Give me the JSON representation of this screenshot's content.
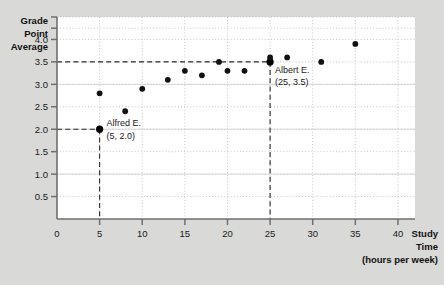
{
  "figure": {
    "background_color": "#d9d9d7",
    "plot_background_color": "#ffffff"
  },
  "axis": {
    "y_title_lines": [
      "Grade",
      "Point",
      "Average"
    ],
    "x_title_lines": [
      "Study",
      "Time",
      "(hours per week)"
    ],
    "y_ticks": [
      "0.5",
      "1.0",
      "1.5",
      "2.0",
      "2.5",
      "3.0",
      "3.5",
      "4.0"
    ],
    "x_ticks": [
      "0",
      "5",
      "10",
      "15",
      "20",
      "25",
      "30",
      "35",
      "40"
    ],
    "origin_label": "0"
  },
  "annotations": [
    {
      "name": "Alfred E.",
      "coords": "(5, 2.0)"
    },
    {
      "name": "Albert E.",
      "coords": "(25, 3.5)"
    }
  ],
  "chart_data": {
    "type": "scatter",
    "title": "",
    "xlabel": "Study Time (hours per week)",
    "ylabel": "Grade Point Average",
    "xlim": [
      0,
      42
    ],
    "ylim": [
      0,
      4.5
    ],
    "grid": true,
    "legend": "none",
    "x": [
      5,
      5,
      8,
      10,
      13,
      15,
      17,
      19,
      20,
      22,
      25,
      25,
      27,
      31,
      35
    ],
    "y": [
      2.0,
      2.8,
      2.4,
      2.9,
      3.1,
      3.3,
      3.2,
      3.5,
      3.3,
      3.3,
      3.5,
      3.6,
      3.6,
      3.5,
      3.9
    ],
    "points": [
      {
        "x": 5,
        "y": 2.0,
        "highlight": true,
        "label": "Alfred E."
      },
      {
        "x": 5,
        "y": 2.8,
        "highlight": false,
        "label": ""
      },
      {
        "x": 8,
        "y": 2.4,
        "highlight": false,
        "label": ""
      },
      {
        "x": 10,
        "y": 2.9,
        "highlight": false,
        "label": ""
      },
      {
        "x": 13,
        "y": 3.1,
        "highlight": false,
        "label": ""
      },
      {
        "x": 15,
        "y": 3.3,
        "highlight": false,
        "label": ""
      },
      {
        "x": 17,
        "y": 3.2,
        "highlight": false,
        "label": ""
      },
      {
        "x": 19,
        "y": 3.5,
        "highlight": false,
        "label": ""
      },
      {
        "x": 20,
        "y": 3.3,
        "highlight": false,
        "label": ""
      },
      {
        "x": 22,
        "y": 3.3,
        "highlight": false,
        "label": ""
      },
      {
        "x": 25,
        "y": 3.5,
        "highlight": true,
        "label": "Albert E."
      },
      {
        "x": 25,
        "y": 3.6,
        "highlight": false,
        "label": ""
      },
      {
        "x": 27,
        "y": 3.6,
        "highlight": false,
        "label": ""
      },
      {
        "x": 31,
        "y": 3.5,
        "highlight": false,
        "label": ""
      },
      {
        "x": 35,
        "y": 3.9,
        "highlight": false,
        "label": ""
      }
    ],
    "reference_lines": [
      {
        "orientation": "horizontal",
        "value": 3.5,
        "to_x": 25,
        "style": "dashed"
      },
      {
        "orientation": "vertical",
        "value": 25,
        "to_y": 3.5,
        "style": "dashed"
      },
      {
        "orientation": "horizontal",
        "value": 2.0,
        "to_x": 5,
        "style": "dashed"
      },
      {
        "orientation": "vertical",
        "value": 5,
        "to_y": 2.0,
        "style": "dashed"
      }
    ]
  }
}
